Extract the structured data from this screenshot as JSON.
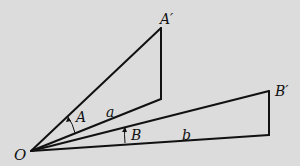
{
  "diagram": {
    "background": "#dcdcdc",
    "stroke": "#111111",
    "points": {
      "O": [
        31,
        151
      ],
      "A_prime": [
        161,
        28
      ],
      "A_foot": [
        161,
        99
      ],
      "B_prime": [
        269,
        91
      ],
      "B_foot": [
        269,
        135
      ]
    },
    "labels": {
      "O": "O",
      "A_prime": "A′",
      "A": "A",
      "a": "a",
      "B_prime": "B′",
      "B": "B",
      "b": "b"
    }
  }
}
